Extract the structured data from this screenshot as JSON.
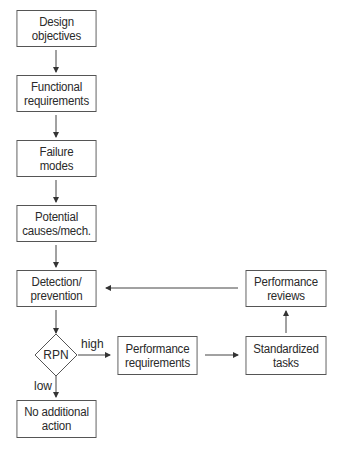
{
  "diagram": {
    "nodes": [
      {
        "id": "design-objectives",
        "label": "Design\nobjectives"
      },
      {
        "id": "functional-requirements",
        "label": "Functional\nrequirements"
      },
      {
        "id": "failure-modes",
        "label": "Failure\nmodes"
      },
      {
        "id": "potential-causes",
        "label": "Potential\ncauses/mech."
      },
      {
        "id": "detection-prevention",
        "label": "Detection/\nprevention"
      },
      {
        "id": "rpn",
        "label": "RPN"
      },
      {
        "id": "no-additional-action",
        "label": "No additional\naction"
      },
      {
        "id": "performance-requirements",
        "label": "Performance\nrequirements"
      },
      {
        "id": "standardized-tasks",
        "label": "Standardized\ntasks"
      },
      {
        "id": "performance-reviews",
        "label": "Performance\nreviews"
      }
    ],
    "edge_labels": {
      "high": "high",
      "low": "low"
    },
    "edges": [
      {
        "from": "design-objectives",
        "to": "functional-requirements"
      },
      {
        "from": "functional-requirements",
        "to": "failure-modes"
      },
      {
        "from": "failure-modes",
        "to": "potential-causes"
      },
      {
        "from": "potential-causes",
        "to": "detection-prevention"
      },
      {
        "from": "detection-prevention",
        "to": "rpn"
      },
      {
        "from": "rpn",
        "to": "performance-requirements",
        "label": "high"
      },
      {
        "from": "rpn",
        "to": "no-additional-action",
        "label": "low"
      },
      {
        "from": "performance-requirements",
        "to": "standardized-tasks"
      },
      {
        "from": "standardized-tasks",
        "to": "performance-reviews"
      },
      {
        "from": "performance-reviews",
        "to": "detection-prevention"
      }
    ],
    "colors": {
      "stroke": "#555555",
      "text": "#2a2a2a",
      "background": "#ffffff"
    }
  }
}
